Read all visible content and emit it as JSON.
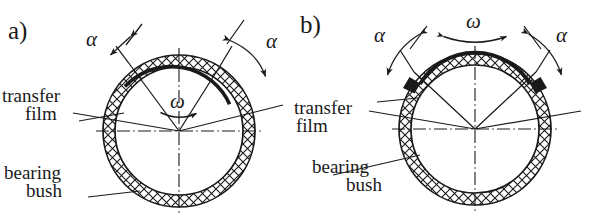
{
  "figure": {
    "type": "technical-diagram",
    "background_color": "#ffffff",
    "line_color": "#1a1a1a",
    "panels": [
      {
        "id": "a",
        "label": "a)",
        "motion": "continuous rotation",
        "center": {
          "x": 179,
          "y": 131
        },
        "outer_radius": 76,
        "inner_radius": 64,
        "omega_symbol": "ω",
        "omega_position": "inside-circle",
        "angle_symbol_left": "α",
        "angle_symbol_right": "α",
        "callouts": [
          {
            "name": "transfer-film",
            "line1": "transfer",
            "line2": "film"
          },
          {
            "name": "bearing-bush",
            "line1": "bearing",
            "line2": "bush"
          }
        ]
      },
      {
        "id": "b",
        "label": "b)",
        "motion": "oscillating rotation",
        "center": {
          "x": 475,
          "y": 129
        },
        "outer_radius": 76,
        "inner_radius": 64,
        "omega_symbol": "ω",
        "omega_position": "above-circle",
        "angle_symbol_left": "α",
        "angle_symbol_right": "α",
        "callouts": [
          {
            "name": "transfer-film",
            "line1": "transfer",
            "line2": "film"
          },
          {
            "name": "bearing-bush",
            "line1": "bearing",
            "line2": "bush"
          }
        ]
      }
    ]
  }
}
